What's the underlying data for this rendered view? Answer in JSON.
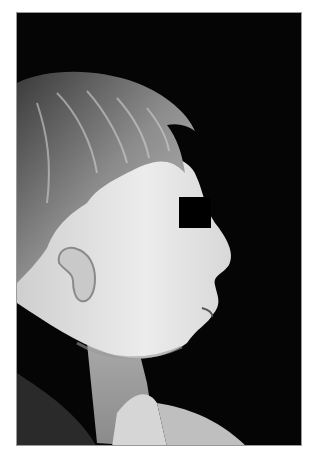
{
  "image": {
    "kind": "clinical profile photograph",
    "description": "Right-facing lateral profile of a young child, black background, eyes masked",
    "colors": {
      "background": "#050505",
      "page": "#ffffff",
      "frame_border": "#9a9a9a",
      "skin_light": "#e6e6e6",
      "skin_mid": "#bdbdbd",
      "hair": "#6a6a6a",
      "eye_bar": "#000000"
    },
    "eye_bar": {
      "x": 162,
      "y": 184,
      "width": 32,
      "height": 31
    }
  }
}
